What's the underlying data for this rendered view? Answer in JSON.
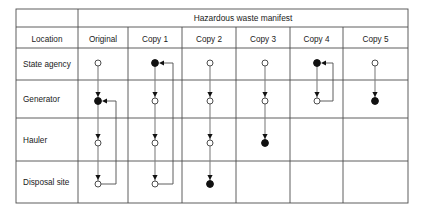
{
  "table": {
    "title": "Hazardous waste manifest",
    "location_header": "Location",
    "row_labels": [
      "State agency",
      "Generator",
      "Hauler",
      "Disposal site"
    ],
    "column_headers": [
      "Original",
      "Copy 1",
      "Copy 2",
      "Copy 3",
      "Copy 4",
      "Copy 5"
    ]
  },
  "legend": {
    "open_node": "open circle",
    "filled_node": "filled circle"
  },
  "diagram_data": {
    "type": "diagram",
    "rows": [
      "State agency",
      "Generator",
      "Hauler",
      "Disposal site"
    ],
    "columns": [
      {
        "name": "Original",
        "nodes": [
          {
            "row": "State agency",
            "style": "open"
          },
          {
            "row": "Generator",
            "style": "filled"
          },
          {
            "row": "Hauler",
            "style": "open"
          },
          {
            "row": "Disposal site",
            "style": "open"
          }
        ],
        "path": [
          "State agency",
          "Generator",
          "Hauler",
          "Disposal site"
        ],
        "return_loop": {
          "from": "Disposal site",
          "to": "Generator"
        }
      },
      {
        "name": "Copy 1",
        "nodes": [
          {
            "row": "State agency",
            "style": "filled"
          },
          {
            "row": "Generator",
            "style": "open"
          },
          {
            "row": "Hauler",
            "style": "open"
          },
          {
            "row": "Disposal site",
            "style": "open"
          }
        ],
        "path": [
          "State agency",
          "Generator",
          "Hauler",
          "Disposal site"
        ],
        "return_loop": {
          "from": "Disposal site",
          "to": "State agency"
        }
      },
      {
        "name": "Copy 2",
        "nodes": [
          {
            "row": "State agency",
            "style": "open"
          },
          {
            "row": "Generator",
            "style": "open"
          },
          {
            "row": "Hauler",
            "style": "open"
          },
          {
            "row": "Disposal site",
            "style": "filled"
          }
        ],
        "path": [
          "State agency",
          "Generator",
          "Hauler",
          "Disposal site"
        ],
        "return_loop": null
      },
      {
        "name": "Copy 3",
        "nodes": [
          {
            "row": "State agency",
            "style": "open"
          },
          {
            "row": "Generator",
            "style": "open"
          },
          {
            "row": "Hauler",
            "style": "filled"
          }
        ],
        "path": [
          "State agency",
          "Generator",
          "Hauler"
        ],
        "return_loop": null
      },
      {
        "name": "Copy 4",
        "nodes": [
          {
            "row": "State agency",
            "style": "filled"
          },
          {
            "row": "Generator",
            "style": "open"
          }
        ],
        "path": [
          "State agency",
          "Generator"
        ],
        "return_loop": {
          "from": "Generator",
          "to": "State agency"
        }
      },
      {
        "name": "Copy 5",
        "nodes": [
          {
            "row": "State agency",
            "style": "open"
          },
          {
            "row": "Generator",
            "style": "filled"
          }
        ],
        "path": [
          "State agency",
          "Generator"
        ],
        "return_loop": null
      }
    ]
  },
  "geometry": {
    "frame": {
      "x": 16,
      "y": 9,
      "w": 392,
      "h": 194
    },
    "title_band_bottom": 27,
    "header_row_bottom": 48,
    "row_dividers": [
      80,
      118,
      161
    ],
    "location_col_right": 78,
    "col_dividers": [
      78,
      128,
      182,
      236,
      290,
      343
    ],
    "col_centers": [
      98,
      155,
      210,
      265,
      317,
      375
    ],
    "row_centers": [
      63,
      101,
      143,
      184
    ],
    "loop_offsets": [
      18,
      18,
      0,
      0,
      16,
      0
    ]
  },
  "colors": {
    "grid": "#4d4d4d",
    "flow": "#808080",
    "node_fill": "#111111",
    "node_open": "#ffffff",
    "text": "#1a1a1a",
    "background": "#ffffff"
  }
}
